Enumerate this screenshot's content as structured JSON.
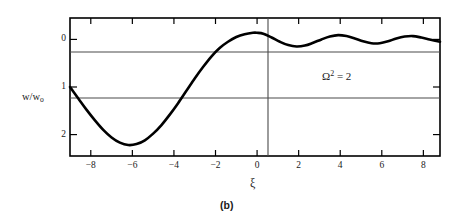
{
  "figure": {
    "caption": "(b)",
    "annotation": "Ω² = 2",
    "annotation_base": "Ω",
    "annotation_exp": "2",
    "annotation_rhs": "= 2",
    "ylabel_main": "w/w",
    "ylabel_sub": "o",
    "xlabel": "ξ",
    "line_color": "#000000",
    "frame_color": "#000000",
    "grid_color": "#555555"
  },
  "chart_data": {
    "type": "line",
    "title": "",
    "subtitle": "",
    "xlabel": "ξ",
    "ylabel": "w/w_o",
    "annotations": [
      {
        "text": "Ω² = 2",
        "x": 3.2,
        "y": 1.0
      }
    ],
    "xlim": [
      -9,
      8.8
    ],
    "ylim": [
      2.45,
      -0.45
    ],
    "y_axis_inverted": true,
    "grid": "horizontal-lines-at-0-and-1",
    "legend": "none",
    "xticks": [
      -8,
      -6,
      -4,
      -2,
      0,
      2,
      4,
      6,
      8
    ],
    "xtick_labels": [
      "-8",
      "-6",
      "-4",
      "-2",
      "0",
      "2",
      "4",
      "6",
      "8"
    ],
    "yticks": [
      0,
      1,
      2
    ],
    "ytick_labels": [
      "0",
      "1",
      "2"
    ],
    "series": [
      {
        "name": "w/w_o",
        "x": [
          -9.0,
          -8.6,
          -8.2,
          -7.8,
          -7.4,
          -7.0,
          -6.6,
          -6.2,
          -5.8,
          -5.4,
          -5.0,
          -4.6,
          -4.2,
          -3.8,
          -3.4,
          -3.0,
          -2.6,
          -2.2,
          -1.8,
          -1.4,
          -1.0,
          -0.6,
          -0.2,
          0.0,
          0.3,
          0.7,
          1.1,
          1.5,
          1.9,
          2.3,
          2.7,
          3.1,
          3.5,
          3.9,
          4.3,
          4.7,
          5.1,
          5.5,
          5.9,
          6.3,
          6.7,
          7.1,
          7.5,
          7.9,
          8.3,
          8.8
        ],
        "y": [
          1.0,
          1.24,
          1.48,
          1.7,
          1.9,
          2.06,
          2.17,
          2.22,
          2.2,
          2.12,
          1.98,
          1.8,
          1.58,
          1.34,
          1.08,
          0.82,
          0.58,
          0.36,
          0.18,
          0.05,
          -0.05,
          -0.11,
          -0.14,
          -0.14,
          -0.12,
          -0.04,
          0.05,
          0.12,
          0.15,
          0.13,
          0.07,
          0.0,
          -0.06,
          -0.09,
          -0.07,
          -0.02,
          0.04,
          0.08,
          0.08,
          0.04,
          -0.02,
          -0.06,
          -0.07,
          -0.04,
          0.0,
          0.05
        ]
      }
    ]
  }
}
